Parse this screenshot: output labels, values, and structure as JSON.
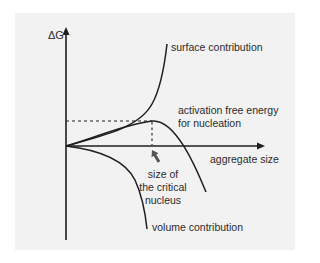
{
  "diagram": {
    "axes": {
      "y_label": "ΔG",
      "x_label": "aggregate size"
    },
    "curves": [
      {
        "name": "surface contribution",
        "label": "surface contribution"
      },
      {
        "name": "total",
        "label": "activation free energy for nucleation"
      },
      {
        "name": "volume contribution",
        "label": "volume contribution"
      }
    ],
    "annotations": {
      "activation_line1": "activation free energy",
      "activation_line2": "for nucleation",
      "critical_line1": "size of",
      "critical_line2": "the critical",
      "critical_line3": "nucleus"
    },
    "colors": {
      "background": "#ffffff",
      "panel": "#f2f2f2",
      "line": "#1e1e1e",
      "arrow": "#555555",
      "text": "#2b2b2b"
    }
  }
}
